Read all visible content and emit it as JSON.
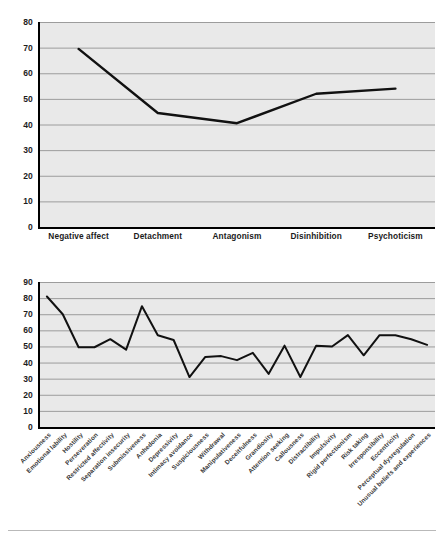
{
  "page": {
    "background_color": "#ffffff",
    "plot_background_color": "#e9e9e9",
    "line_color": "#111111",
    "gridline_color": "#9c9c9c",
    "axis_color": "#000000"
  },
  "chart_data": [
    {
      "id": "pid5-domains",
      "type": "line",
      "title": "",
      "xlabel": "",
      "ylabel": "",
      "ylim": [
        0,
        80
      ],
      "ytick_step": 10,
      "yticks": [
        0,
        10,
        20,
        30,
        40,
        50,
        60,
        70,
        80
      ],
      "grid": true,
      "legend": false,
      "categories": [
        "Negative affect",
        "Detachment",
        "Antagonism",
        "Disinhibition",
        "Psychoticism"
      ],
      "values": [
        69.5,
        44.5,
        40.5,
        52.0,
        54.0
      ]
    },
    {
      "id": "pid5-facets",
      "type": "line",
      "title": "",
      "xlabel": "",
      "ylabel": "",
      "ylim": [
        0,
        90
      ],
      "ytick_step": 10,
      "yticks": [
        0,
        10,
        20,
        30,
        40,
        50,
        60,
        70,
        80,
        90
      ],
      "grid": true,
      "legend": false,
      "categories": [
        "Anxiousness",
        "Emotional lability",
        "Hostility",
        "Perseveration",
        "Restricted affectivity",
        "Separation insecurity",
        "Submissiveness",
        "Anhedonia",
        "Depressivity",
        "Intimacy avoidance",
        "Suspiciousness",
        "Withdrawal",
        "Manipulativeness",
        "Deceitfulness",
        "Grandiosity",
        "Attention seeking",
        "Callousness",
        "Distractibility",
        "Impulsivity",
        "Rigid perfectionism",
        "Risk taking",
        "Irresponsibility",
        "Eccentricity",
        "Perceptual dysregulation",
        "Unusual beliefs and experiences"
      ],
      "values": [
        81.0,
        70.0,
        49.5,
        49.5,
        54.5,
        48.0,
        75.0,
        57.0,
        54.0,
        31.0,
        43.5,
        44.0,
        41.5,
        46.0,
        33.0,
        50.5,
        31.0,
        50.5,
        50.0,
        57.0,
        44.5,
        57.0,
        57.0,
        54.5,
        51.0
      ]
    }
  ]
}
